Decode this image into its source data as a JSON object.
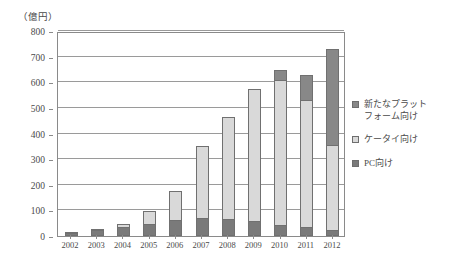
{
  "chart_data": {
    "type": "bar",
    "stacked": true,
    "title": "",
    "subtitle": "",
    "unit_label": "（億円）",
    "xlabel": "",
    "ylabel": "",
    "ylim": [
      0,
      800
    ],
    "ytick_step": 100,
    "ytick_labels": [
      "0",
      "100",
      "200",
      "300",
      "400",
      "500",
      "600",
      "700",
      "800"
    ],
    "ytick_values": [
      0,
      100,
      200,
      300,
      400,
      500,
      600,
      700,
      800
    ],
    "grid": true,
    "legend_position": "right",
    "categories": [
      "2002",
      "2003",
      "2004",
      "2005",
      "2006",
      "2007",
      "2008",
      "2009",
      "2010",
      "2011",
      "2012"
    ],
    "stack_order_bottom_to_top": [
      "PC向け",
      "ケータイ向け",
      "新たなプラットフォーム向け"
    ],
    "series": [
      {
        "name": "PC向け",
        "legend_label": "PC向け",
        "color": "#7a7a7a",
        "values": [
          10,
          22,
          35,
          48,
          62,
          70,
          66,
          58,
          44,
          35,
          22
        ]
      },
      {
        "name": "ケータイ向け",
        "legend_label": "ケータイ向け",
        "color": "#d9d9d9",
        "values": [
          2,
          5,
          10,
          48,
          115,
          280,
          399,
          517,
          563,
          497,
          334
        ]
      },
      {
        "name": "新たなプラットフォーム向け",
        "legend_label": "新たなプラット\nフォーム向け",
        "color": "#888888",
        "values": [
          0,
          0,
          0,
          0,
          0,
          0,
          0,
          0,
          40,
          95,
          375
        ]
      }
    ],
    "totals": [
      12,
      27,
      45,
      96,
      177,
      350,
      465,
      575,
      647,
      627,
      731
    ]
  },
  "legend": {
    "items": [
      {
        "label": "新たなプラット\nフォーム向け",
        "color": "#888888"
      },
      {
        "label": "ケータイ向け",
        "color": "#d9d9d9"
      },
      {
        "label": "PC向け",
        "color": "#7a7a7a"
      }
    ]
  },
  "colors": {
    "axis": "#8a8a8a",
    "grid": "#9a9a9a",
    "text": "#4a4a4a",
    "bar_border": "#707070",
    "background": "#ffffff"
  }
}
